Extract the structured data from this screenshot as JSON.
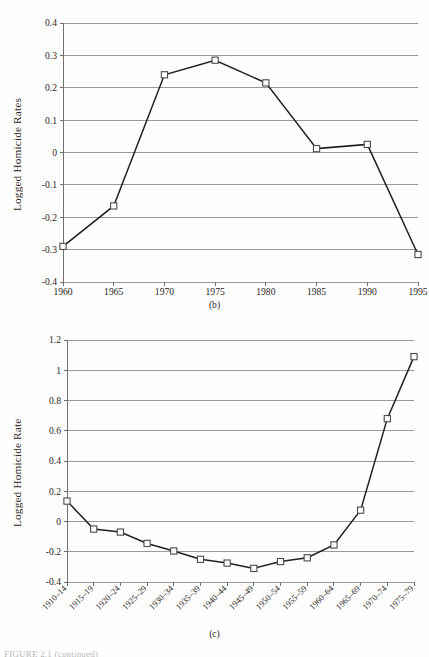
{
  "document": {
    "figure_note": "FIGURE 2.1 (continued)"
  },
  "panels": {
    "b": {
      "caption": "(b)",
      "ylabel": "Logged Homicide Rates"
    },
    "c": {
      "caption": "(c)",
      "ylabel": "Logged Homicide Rate"
    }
  },
  "chart_data": [
    {
      "type": "line",
      "title": "(b)",
      "xlabel": "",
      "ylabel": "Logged Homicide Rates",
      "categories": [
        "1960",
        "1965",
        "1970",
        "1975",
        "1980",
        "1985",
        "1990",
        "1995"
      ],
      "values": [
        -0.29,
        -0.165,
        0.24,
        0.285,
        0.215,
        0.012,
        0.025,
        -0.315
      ],
      "ylim": [
        -0.4,
        0.4
      ],
      "yticks": [
        "0.4",
        "0.3",
        "0.2",
        "0.1",
        "0",
        "-0.1",
        "-0.2",
        "-0.3",
        "-0.4"
      ],
      "ytick_values": [
        0.4,
        0.3,
        0.2,
        0.1,
        0,
        -0.1,
        -0.2,
        -0.3,
        -0.4
      ],
      "grid": true,
      "legend": "none",
      "marker": "open-square"
    },
    {
      "type": "line",
      "title": "(c)",
      "xlabel": "",
      "ylabel": "Logged Homicide Rate",
      "categories": [
        "1910–14",
        "1915–19",
        "1920–24",
        "1925–29",
        "1930–34",
        "1935–39",
        "1940–44",
        "1945–49",
        "1950–54",
        "1955–59",
        "1960–64",
        "1965–69",
        "1970–74",
        "1975–79"
      ],
      "values": [
        0.135,
        -0.05,
        -0.07,
        -0.145,
        -0.195,
        -0.25,
        -0.275,
        -0.31,
        -0.265,
        -0.24,
        -0.155,
        0.075,
        0.68,
        1.09
      ],
      "ylim": [
        -0.4,
        1.2
      ],
      "yticks": [
        "1.2",
        "1",
        "0.8",
        "0.6",
        "0.4",
        "0.2",
        "0",
        "-0.2",
        "-0.4"
      ],
      "ytick_values": [
        1.2,
        1,
        0.8,
        0.6,
        0.4,
        0.2,
        0,
        -0.2,
        -0.4
      ],
      "grid": true,
      "legend": "none",
      "marker": "open-square"
    }
  ],
  "colors": {
    "line": "#231f20",
    "grid": "#8e8e8e",
    "axis": "#6f6f6f",
    "marker_fill": "#ffffff",
    "marker_stroke": "#4a4a4a",
    "text": "#2a2523",
    "background": "#fefefe"
  }
}
